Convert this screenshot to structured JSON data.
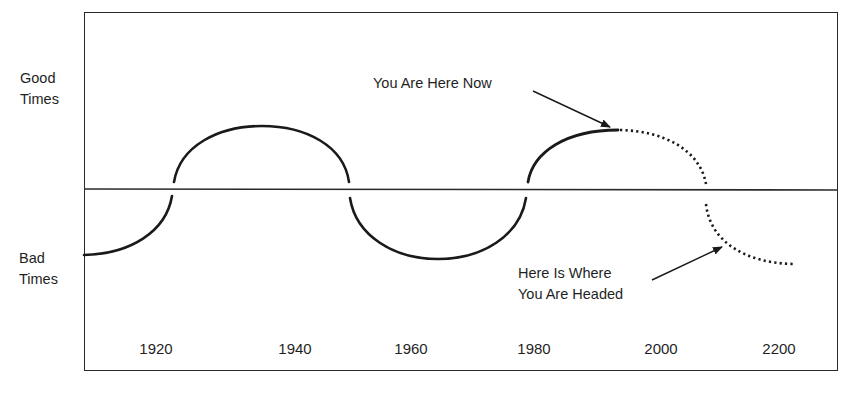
{
  "figure": {
    "y_labels": {
      "good": [
        "Good",
        "Times"
      ],
      "bad": [
        "Bad",
        "Times"
      ]
    },
    "x_ticks": [
      {
        "label": "1920",
        "x": 156
      },
      {
        "label": "1940",
        "x": 295
      },
      {
        "label": "1960",
        "x": 411
      },
      {
        "label": "1980",
        "x": 534
      },
      {
        "label": "2000",
        "x": 661
      },
      {
        "label": "2200",
        "x": 779
      }
    ],
    "annotations": {
      "now": {
        "lines": [
          "You Are Here Now"
        ],
        "points_to": "peak of current good-times arc"
      },
      "headed": {
        "lines": [
          "Here Is Where",
          "You Are Headed"
        ],
        "points_to": "projected dotted bad-times arc"
      }
    },
    "colors": {
      "line": "#1a1a1a",
      "frame": "#2a2a2a",
      "background": "#ffffff"
    }
  }
}
